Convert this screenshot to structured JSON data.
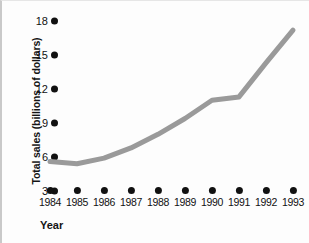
{
  "chart_data": {
    "type": "line",
    "title": "",
    "xlabel": "Year",
    "ylabel": "Total sales (billions of dollars)",
    "categories": [
      "1984",
      "1985",
      "1986",
      "1987",
      "1988",
      "1989",
      "1990",
      "1991",
      "1992",
      "1993"
    ],
    "x": [
      1984,
      1985,
      1986,
      1987,
      1988,
      1989,
      1990,
      1991,
      1992,
      1993
    ],
    "values": [
      5.6,
      5.4,
      5.9,
      6.8,
      8.0,
      9.4,
      11.0,
      11.3,
      14.3,
      17.2
    ],
    "series": [
      {
        "name": "Total sales",
        "values": [
          5.6,
          5.4,
          5.9,
          6.8,
          8.0,
          9.4,
          11.0,
          11.3,
          14.3,
          17.2
        ],
        "color": "#9a9a9a"
      }
    ],
    "yticks": [
      3,
      6,
      9,
      12,
      15,
      18
    ],
    "ytick_labels": [
      "3",
      "6",
      "9",
      "12",
      "15",
      "18"
    ],
    "xtick_labels": [
      "1984",
      "1985",
      "1986",
      "1987",
      "1988",
      "1989",
      "1990",
      "1991",
      "1992",
      "1993"
    ],
    "ylim": [
      3,
      18
    ],
    "xlim": [
      1984,
      1993
    ],
    "grid": false,
    "legend": false,
    "legend_position": "none",
    "line_color": "#9a9a9a",
    "line_width": 5,
    "marker_color": "#111111",
    "background": "#fdfdfd"
  },
  "axes": {
    "y_title": "Total sales (billions of dollars)",
    "x_title": "Year"
  }
}
